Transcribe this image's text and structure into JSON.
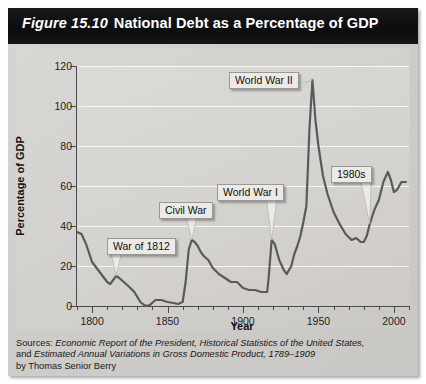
{
  "figure": {
    "number": "Figure 15.10",
    "title": "National Debt as a Percentage of GDP"
  },
  "sources": {
    "line1_label": "Sources:",
    "line1_italic": "Economic Report of the President, Historical Statistics of the United States,",
    "line2_prefix": "and",
    "line2_italic": "Estimated Annual Variations in Gross Domestic Product, 1789–1909",
    "line3": "by Thomas Senior Berry"
  },
  "chart_data": {
    "type": "line",
    "title": "National Debt as a Percentage of GDP",
    "xlabel": "Year",
    "ylabel": "Percentage of GDP",
    "xlim": [
      1790,
      2010
    ],
    "ylim": [
      0,
      120
    ],
    "yticks": [
      0,
      20,
      40,
      60,
      80,
      100,
      120
    ],
    "xticks_major": [
      1800,
      1850,
      1900,
      1950,
      2000
    ],
    "xtick_labels": [
      "1800",
      "1850",
      "1900",
      "1950",
      "2000"
    ],
    "xticks_minor": [
      1790,
      1810,
      1820,
      1830,
      1840,
      1860,
      1870,
      1880,
      1890,
      1910,
      1920,
      1930,
      1940,
      1960,
      1970,
      1980,
      1990,
      2010
    ],
    "grid": "horizontal",
    "legend": "none",
    "line_color": "#5a5a58",
    "series": [
      {
        "name": "National debt as percentage of GDP",
        "x": [
          1790,
          1793,
          1796,
          1800,
          1803,
          1806,
          1810,
          1812,
          1814,
          1816,
          1818,
          1821,
          1824,
          1828,
          1832,
          1835,
          1838,
          1842,
          1846,
          1850,
          1854,
          1857,
          1860,
          1862,
          1864,
          1866,
          1868,
          1870,
          1872,
          1874,
          1877,
          1880,
          1884,
          1888,
          1892,
          1896,
          1900,
          1904,
          1908,
          1912,
          1916,
          1917,
          1919,
          1921,
          1924,
          1927,
          1929,
          1932,
          1934,
          1936,
          1938,
          1940,
          1942,
          1944,
          1946,
          1948,
          1950,
          1953,
          1956,
          1960,
          1964,
          1968,
          1972,
          1975,
          1978,
          1980,
          1982,
          1984,
          1987,
          1990,
          1993,
          1996,
          1998,
          2000,
          2002,
          2005,
          2008
        ],
        "y": [
          37,
          36,
          31,
          22,
          19,
          16,
          12,
          11,
          13,
          15,
          14,
          12,
          10,
          7,
          2,
          0.2,
          0.3,
          3,
          3,
          2,
          1.5,
          1,
          2,
          12,
          28,
          33,
          32,
          30,
          27,
          25,
          23,
          19,
          16,
          14,
          12,
          12,
          9,
          8,
          8,
          7,
          7,
          14,
          33,
          31,
          23,
          18,
          16,
          20,
          26,
          30,
          35,
          42,
          50,
          88,
          113,
          93,
          80,
          65,
          56,
          47,
          41,
          36,
          33,
          34,
          32,
          32,
          35,
          41,
          48,
          53,
          62,
          67,
          63,
          57,
          58,
          62,
          62
        ]
      }
    ],
    "annotations": [
      {
        "label": "War of 1812",
        "points_to_year": 1816,
        "points_to_value": 15
      },
      {
        "label": "Civil War",
        "points_to_year": 1866,
        "points_to_value": 33
      },
      {
        "label": "World War I",
        "points_to_year": 1919,
        "points_to_value": 33
      },
      {
        "label": "World War II",
        "points_to_year": 1946,
        "points_to_value": 113
      },
      {
        "label": "1980s",
        "points_to_year": 1984,
        "points_to_value": 41
      }
    ]
  }
}
